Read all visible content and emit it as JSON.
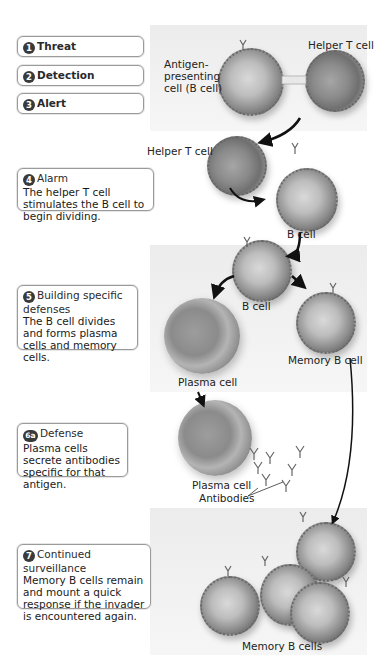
{
  "steps": [
    {
      "badge": "1",
      "title": "Threat"
    },
    {
      "badge": "2",
      "title": "Detection"
    },
    {
      "badge": "3",
      "title": "Alert"
    },
    {
      "badge": "4",
      "title": "Alarm",
      "text": "The helper T cell stimulates the B cell to begin dividing."
    },
    {
      "badge": "5",
      "title": "Building specific defenses",
      "text": "The B cell divides and forms plasma cells and memory cells."
    },
    {
      "badge": "6a",
      "title": "Defense",
      "text": "Plasma cells secrete antibodies specific for that antigen."
    },
    {
      "badge": "7",
      "title": "Continued surveillance",
      "text": "Memory B cells remain and mount a quick response if the invader is encountered again."
    }
  ],
  "labels": {
    "antigen_presenting": "Antigen-\npresenting\ncell (B cell)",
    "helper_t_top": "Helper T cell",
    "helper_t_mid": "Helper T cell",
    "b_cell_1": "B cell",
    "b_cell_2": "B cell",
    "memory_b_cell": "Memory B cell",
    "plasma_cell_1": "Plasma cell",
    "plasma_cell_2": "Plasma cell",
    "antibodies": "Antibodies",
    "memory_b_cells": "Memory B cells"
  },
  "colors": {
    "band": "#efefef",
    "box_border": "#9a9a9a",
    "badge": "#3a3a3a",
    "arrow": "#111111"
  }
}
